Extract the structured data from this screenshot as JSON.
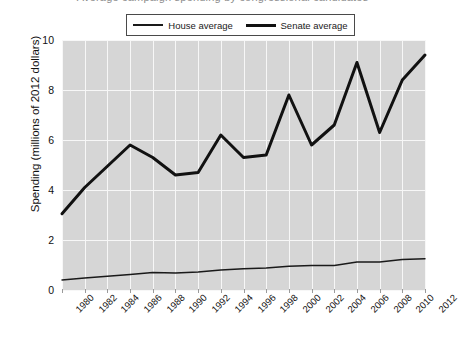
{
  "figure": {
    "title": "Average campaign spending by congressional candidates",
    "background_color": "#ffffff",
    "plot_background_color": "#d6d6d6",
    "gridline_color": "#f7f7f7"
  },
  "legend": {
    "position": "top-center",
    "entries": [
      {
        "label": "House average",
        "style": "thin-line",
        "color": "#1a1a1a"
      },
      {
        "label": "Senate average",
        "style": "thick-line",
        "color": "#111111"
      }
    ]
  },
  "chart_data": {
    "type": "line",
    "title": "Average campaign spending by congressional candidates",
    "xlabel": "",
    "ylabel": "Spending (millions of 2012 dollars)",
    "x": [
      1980,
      1982,
      1984,
      1986,
      1988,
      1990,
      1992,
      1994,
      1996,
      1998,
      2000,
      2002,
      2004,
      2006,
      2008,
      2010,
      2012
    ],
    "categories": [
      "1980",
      "1982",
      "1984",
      "1986",
      "1988",
      "1990",
      "1992",
      "1994",
      "1996",
      "1998",
      "2000",
      "2002",
      "2004",
      "2006",
      "2008",
      "2010",
      "2012"
    ],
    "xlim": [
      1980,
      2012
    ],
    "ylim": [
      0,
      10
    ],
    "yticks": [
      0,
      2,
      4,
      6,
      8,
      10
    ],
    "ytick_labels": [
      "0",
      "2",
      "4",
      "6",
      "8",
      "10"
    ],
    "grid": true,
    "legend_position": "top-center",
    "series": [
      {
        "name": "House average",
        "color": "#1a1a1a",
        "line_width": 1.4,
        "values": [
          0.4,
          0.48,
          0.55,
          0.62,
          0.7,
          0.68,
          0.72,
          0.8,
          0.85,
          0.88,
          0.95,
          0.98,
          0.98,
          1.12,
          1.12,
          1.22,
          1.25
        ]
      },
      {
        "name": "Senate average",
        "color": "#111111",
        "line_width": 3.0,
        "values": [
          3.05,
          4.1,
          4.95,
          5.8,
          5.3,
          4.6,
          4.7,
          6.2,
          5.3,
          5.4,
          7.8,
          5.8,
          6.6,
          9.1,
          6.3,
          8.4,
          9.4
        ]
      }
    ]
  }
}
